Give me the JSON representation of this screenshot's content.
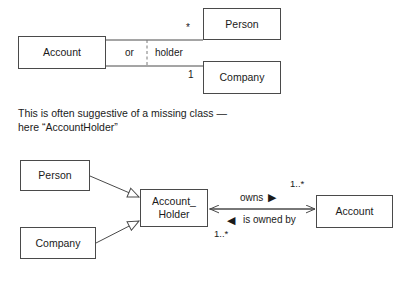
{
  "diagram": {
    "background_color": "#ffffff",
    "stroke_color": "#4a4a4a",
    "text_color": "#1a1a1a"
  },
  "top_diagram": {
    "classes": {
      "account": "Account",
      "person": "Person",
      "company": "Company"
    },
    "association": {
      "role_label": "holder",
      "xor_label": "or",
      "person_multiplicity": "*",
      "company_multiplicity": "1"
    }
  },
  "note": {
    "line1": "This is often suggestive of a missing class —",
    "line2": "here “AccountHolder”",
    "text": "This is often suggestive of a missing class —\nhere “AccountHolder”"
  },
  "bottom_diagram": {
    "classes": {
      "person": "Person",
      "company": "Company",
      "account_holder_line1": "Account_",
      "account_holder_line2": "Holder",
      "account": "Account"
    },
    "association": {
      "forward_label": "owns",
      "forward_marker": "▶",
      "reverse_label": "is owned by",
      "reverse_marker": "◀",
      "source_multiplicity": "1..*",
      "target_multiplicity": "1..*"
    },
    "generalizations": [
      {
        "from": "Person",
        "to": "Account_Holder",
        "arrow": "hollow-triangle"
      },
      {
        "from": "Company",
        "to": "Account_Holder",
        "arrow": "hollow-triangle"
      }
    ]
  }
}
